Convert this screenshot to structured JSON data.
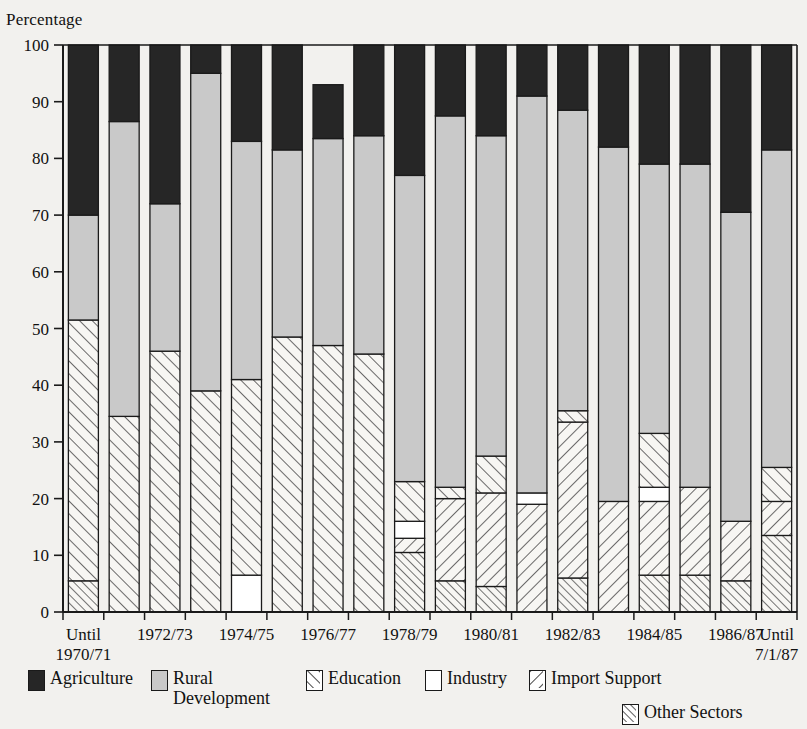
{
  "axis": {
    "y_title": "Percentage",
    "y_ticks": [
      0,
      10,
      20,
      30,
      40,
      50,
      60,
      70,
      80,
      90,
      100
    ],
    "y_min": 0,
    "y_max": 100
  },
  "legend": {
    "items": [
      {
        "key": "agriculture",
        "label": "Agriculture",
        "label_line2": "",
        "swatch": "solid-black-swatch"
      },
      {
        "key": "rural",
        "label": "Rural",
        "label_line2": "Development",
        "swatch": "solid-gray-swatch"
      },
      {
        "key": "education",
        "label": "Education",
        "label_line2": "",
        "swatch": "forward-hatch-swatch"
      },
      {
        "key": "industry",
        "label": "Industry",
        "label_line2": "",
        "swatch": "white-swatch"
      },
      {
        "key": "import_support",
        "label": "Import Support",
        "label_line2": "",
        "swatch": "back-hatch-swatch"
      },
      {
        "key": "other",
        "label": "Other Sectors",
        "label_line2": "",
        "swatch": "dense-hatch-swatch"
      }
    ]
  },
  "chart_data": {
    "type": "bar",
    "stacked": true,
    "title": "",
    "subtitle": "",
    "xlabel": "",
    "ylabel": "Percentage",
    "ylim": [
      0,
      100
    ],
    "grid": false,
    "legend_position": "bottom",
    "categories": [
      "Until\n1970/71",
      "1971/72",
      "1972/73",
      "1973/74",
      "1974/75",
      "1975/76",
      "1976/77",
      "1977/78",
      "1978/79",
      "1979/80",
      "1980/81",
      "1981/82",
      "1982/83",
      "1983/84",
      "1984/85",
      "1985/86",
      "1986/87",
      "Until\n7/1/87"
    ],
    "tick_labels": [
      "Until\n1970/71",
      "",
      "1972/73",
      "",
      "1974/75",
      "",
      "1976/77",
      "",
      "1978/79",
      "",
      "1980/81",
      "",
      "1982/83",
      "",
      "1984/85",
      "",
      "1986/87",
      "Until\n7/1/87"
    ],
    "series": [
      {
        "name": "Other Sectors",
        "key": "other",
        "values": [
          5.5,
          0,
          0,
          0,
          0,
          0,
          0,
          0,
          10.5,
          5.5,
          4.5,
          0,
          6.0,
          0,
          6.5,
          6.5,
          5.5,
          13.5
        ]
      },
      {
        "name": "Import Support",
        "key": "import_support",
        "values": [
          0,
          0,
          0,
          0,
          0,
          0,
          0,
          0,
          2.5,
          14.5,
          16.5,
          19.0,
          27.5,
          19.5,
          13.0,
          15.5,
          10.5,
          6.0
        ]
      },
      {
        "name": "Industry",
        "key": "industry",
        "values": [
          0,
          0,
          0,
          0,
          6.5,
          0,
          0,
          0,
          3.0,
          0,
          0,
          2.0,
          0,
          0,
          2.5,
          0,
          0,
          0
        ]
      },
      {
        "name": "Education",
        "key": "education",
        "values": [
          46.0,
          34.5,
          46.0,
          39.0,
          34.5,
          48.5,
          47.0,
          45.5,
          7.0,
          2.0,
          6.5,
          0,
          2.0,
          0,
          9.5,
          0,
          0,
          6.0
        ]
      },
      {
        "name": "Rural Development",
        "key": "rural",
        "values": [
          18.5,
          52.0,
          26.0,
          56.0,
          42.0,
          33.0,
          36.5,
          38.5,
          54.0,
          65.5,
          56.5,
          70.0,
          53.0,
          62.5,
          47.5,
          57.0,
          54.5,
          56.0
        ]
      },
      {
        "name": "Agriculture",
        "key": "agriculture",
        "values": [
          30.0,
          13.5,
          28.0,
          5.0,
          17.0,
          18.5,
          9.5,
          16.0,
          23.0,
          12.5,
          16.0,
          9.0,
          11.5,
          18.0,
          21.0,
          21.0,
          29.5,
          18.5
        ]
      }
    ],
    "stack_order_bottom_to_top": [
      "other",
      "import_support",
      "industry",
      "education",
      "rural",
      "agriculture"
    ],
    "cumulative_tops": [
      {
        "category": "Until\n1970/71",
        "other": 5.5,
        "import_support": 5.5,
        "industry": 5.5,
        "education": 51.5,
        "rural": 70.0,
        "agriculture": 100
      },
      {
        "category": "1971/72",
        "other": 0,
        "import_support": 0,
        "industry": 0,
        "education": 34.5,
        "rural": 86.5,
        "agriculture": 100
      },
      {
        "category": "1972/73",
        "other": 0,
        "import_support": 0,
        "industry": 0,
        "education": 46.0,
        "rural": 72.0,
        "agriculture": 100
      },
      {
        "category": "1973/74",
        "other": 0,
        "import_support": 0,
        "industry": 0,
        "education": 39.0,
        "rural": 95.0,
        "agriculture": 100
      },
      {
        "category": "1974/75",
        "other": 0,
        "import_support": 0,
        "industry": 6.5,
        "education": 41.0,
        "rural": 83.0,
        "agriculture": 100
      },
      {
        "category": "1975/76",
        "other": 0,
        "import_support": 0,
        "industry": 0,
        "education": 48.5,
        "rural": 81.5,
        "agriculture": 100
      },
      {
        "category": "1976/77",
        "other": 0,
        "import_support": 0,
        "industry": 0,
        "education": 47.0,
        "rural": 90.5,
        "agriculture": 100
      },
      {
        "category": "1977/78",
        "other": 0,
        "import_support": 0,
        "industry": 0,
        "education": 45.5,
        "rural": 84.0,
        "agriculture": 100
      },
      {
        "category": "1978/79",
        "other": 10.5,
        "import_support": 13.0,
        "industry": 16.0,
        "education": 23.0,
        "rural": 77.0,
        "agriculture": 100
      },
      {
        "category": "1979/80",
        "other": 5.5,
        "import_support": 20.0,
        "industry": 20.0,
        "education": 22.0,
        "rural": 87.5,
        "agriculture": 100
      },
      {
        "category": "1980/81",
        "other": 4.5,
        "import_support": 21.0,
        "industry": 21.0,
        "education": 27.5,
        "rural": 84.0,
        "agriculture": 100
      },
      {
        "category": "1981/82",
        "other": 0,
        "import_support": 19.0,
        "industry": 21.0,
        "education": 21.0,
        "rural": 91.0,
        "agriculture": 100
      },
      {
        "category": "1982/83",
        "other": 6.0,
        "import_support": 33.5,
        "industry": 33.5,
        "education": 35.5,
        "rural": 88.5,
        "agriculture": 100
      },
      {
        "category": "1983/84",
        "other": 0,
        "import_support": 19.5,
        "industry": 19.5,
        "education": 19.5,
        "rural": 82.0,
        "agriculture": 100
      },
      {
        "category": "1984/85",
        "other": 6.5,
        "import_support": 19.5,
        "industry": 22.0,
        "education": 31.5,
        "rural": 79.0,
        "agriculture": 100
      },
      {
        "category": "1985/86",
        "other": 6.5,
        "import_support": 22.0,
        "industry": 22.0,
        "education": 22.0,
        "rural": 79.0,
        "agriculture": 100
      },
      {
        "category": "1986/87",
        "other": 5.5,
        "import_support": 16.0,
        "industry": 16.0,
        "education": 16.0,
        "rural": 70.5,
        "agriculture": 100
      },
      {
        "category": "Until\n7/1/87",
        "other": 13.5,
        "import_support": 19.5,
        "industry": 19.5,
        "education": 25.5,
        "rural": 81.5,
        "agriculture": 100
      }
    ]
  },
  "colors": {
    "agriculture": "#262626",
    "rural": "#c9c9c9",
    "hatch_fill": "#f7f6f3",
    "industry": "#ffffff",
    "stroke": "#1a1a1a",
    "background": "#f2f1ee"
  }
}
